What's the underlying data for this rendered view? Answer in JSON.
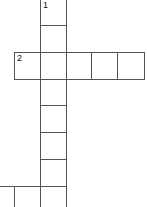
{
  "puzzle": {
    "type": "crossword",
    "clue_numbers": {
      "one": "1",
      "two": "2"
    },
    "cell_size": 26,
    "cells": [
      {
        "x": 40,
        "y": -1,
        "w": 27,
        "h": 27,
        "num": "1"
      },
      {
        "x": 40,
        "y": 25,
        "w": 27,
        "h": 28,
        "num": ""
      },
      {
        "x": 14,
        "y": 52,
        "w": 27,
        "h": 28,
        "num": "2"
      },
      {
        "x": 40,
        "y": 52,
        "w": 27,
        "h": 28,
        "num": ""
      },
      {
        "x": 66,
        "y": 52,
        "w": 26,
        "h": 28,
        "num": ""
      },
      {
        "x": 91,
        "y": 52,
        "w": 27,
        "h": 28,
        "num": ""
      },
      {
        "x": 117,
        "y": 52,
        "w": 28,
        "h": 28,
        "num": ""
      },
      {
        "x": 40,
        "y": 79,
        "w": 27,
        "h": 27,
        "num": ""
      },
      {
        "x": 40,
        "y": 105,
        "w": 27,
        "h": 28,
        "num": ""
      },
      {
        "x": 40,
        "y": 132,
        "w": 27,
        "h": 28,
        "num": ""
      },
      {
        "x": 40,
        "y": 159,
        "w": 27,
        "h": 28,
        "num": ""
      },
      {
        "x": -12,
        "y": 186,
        "w": 27,
        "h": 28,
        "num": ""
      },
      {
        "x": 14,
        "y": 186,
        "w": 27,
        "h": 28,
        "num": ""
      },
      {
        "x": 40,
        "y": 186,
        "w": 27,
        "h": 28,
        "num": ""
      }
    ]
  }
}
